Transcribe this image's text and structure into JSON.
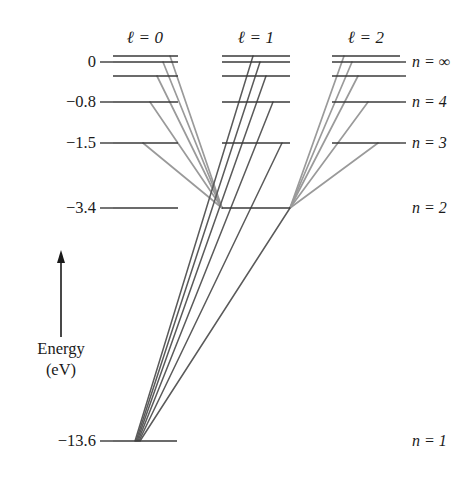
{
  "figure": {
    "background_color": "#ffffff",
    "width": 472,
    "height": 481
  },
  "axis": {
    "title_line1": "Energy",
    "title_line2": "(eV)",
    "arrow_direction": "up",
    "arrow_color": "#1a1a1a",
    "ticks": [
      {
        "label": "0",
        "y": 62
      },
      {
        "label": "−0.8",
        "y": 102
      },
      {
        "label": "−1.5",
        "y": 143
      },
      {
        "label": "−3.4",
        "y": 208
      },
      {
        "label": "−13.6",
        "y": 441
      }
    ]
  },
  "columns": [
    {
      "id": "l0",
      "header": "ℓ = 0",
      "header_x": 145,
      "x_start": 113,
      "x_end": 178
    },
    {
      "id": "l1",
      "header": "ℓ = 1",
      "header_x": 256,
      "x_start": 222,
      "x_end": 290
    },
    {
      "id": "l2",
      "header": "ℓ = 2",
      "header_x": 366,
      "x_start": 332,
      "x_end": 400
    }
  ],
  "right_labels": [
    {
      "label": "n = ∞",
      "y": 62
    },
    {
      "label": "n = 4",
      "y": 102
    },
    {
      "label": "n = 3",
      "y": 143
    },
    {
      "label": "n = 2",
      "y": 208
    },
    {
      "label": "n = 1",
      "y": 441
    }
  ],
  "level_color": "#3a3a3a",
  "transition_colors": {
    "light": "#9a9a9a",
    "dark": "#5a5a5a"
  },
  "chart_data": {
    "type": "line",
    "xlabel": "Orbital angular momentum quantum number ℓ",
    "ylabel": "Energy (eV)",
    "ylim": [
      -13.6,
      0
    ],
    "grid": false,
    "legend": "none",
    "x_categories": [
      "ℓ = 0",
      "ℓ = 1",
      "ℓ = 2"
    ],
    "y_tick_labels": [
      "0",
      "−0.8",
      "−1.5",
      "−3.4",
      "−13.6"
    ],
    "y_tick_values": [
      0,
      -0.8,
      -1.5,
      -3.4,
      -13.6
    ],
    "levels": [
      {
        "column": "l0",
        "n": "∞",
        "energy": 0.0,
        "y": 56,
        "x1": 113,
        "x2": 178
      },
      {
        "column": "l0",
        "n": "6",
        "energy": -0.38,
        "y": 62,
        "x1": 113,
        "x2": 178
      },
      {
        "column": "l0",
        "n": "5",
        "energy": -0.54,
        "y": 76,
        "x1": 113,
        "x2": 178
      },
      {
        "column": "l0",
        "n": "4",
        "energy": -0.85,
        "y": 102,
        "x1": 113,
        "x2": 178
      },
      {
        "column": "l0",
        "n": "3",
        "energy": -1.51,
        "y": 143,
        "x1": 113,
        "x2": 178
      },
      {
        "column": "l0",
        "n": "2",
        "energy": -3.4,
        "y": 208,
        "x1": 113,
        "x2": 178
      },
      {
        "column": "l0",
        "n": "1",
        "energy": -13.6,
        "y": 441,
        "x1": 113,
        "x2": 177
      },
      {
        "column": "l1",
        "n": "∞",
        "energy": 0.0,
        "y": 56,
        "x1": 222,
        "x2": 290
      },
      {
        "column": "l1",
        "n": "6",
        "energy": -0.38,
        "y": 62,
        "x1": 222,
        "x2": 290
      },
      {
        "column": "l1",
        "n": "5",
        "energy": -0.54,
        "y": 76,
        "x1": 222,
        "x2": 290
      },
      {
        "column": "l1",
        "n": "4",
        "energy": -0.85,
        "y": 102,
        "x1": 222,
        "x2": 290
      },
      {
        "column": "l1",
        "n": "3",
        "energy": -1.51,
        "y": 143,
        "x1": 222,
        "x2": 290
      },
      {
        "column": "l1",
        "n": "2",
        "energy": -3.4,
        "y": 208,
        "x1": 222,
        "x2": 290
      },
      {
        "column": "l2",
        "n": "∞",
        "energy": 0.0,
        "y": 56,
        "x1": 332,
        "x2": 400
      },
      {
        "column": "l2",
        "n": "6",
        "energy": -0.38,
        "y": 62,
        "x1": 332,
        "x2": 400
      },
      {
        "column": "l2",
        "n": "5",
        "energy": -0.54,
        "y": 76,
        "x1": 332,
        "x2": 400
      },
      {
        "column": "l2",
        "n": "4",
        "energy": -0.85,
        "y": 102,
        "x1": 332,
        "x2": 400
      },
      {
        "column": "l2",
        "n": "3",
        "energy": -1.51,
        "y": 143,
        "x1": 332,
        "x2": 400
      }
    ],
    "transitions": [
      {
        "from_column": "l0",
        "to_column": "l1",
        "from_n": "∞",
        "to_n": "2",
        "x1": 170,
        "y1": 56,
        "x2": 222,
        "y2": 208,
        "shade": "light"
      },
      {
        "from_column": "l0",
        "to_column": "l1",
        "from_n": "6",
        "to_n": "2",
        "x1": 163,
        "y1": 62,
        "x2": 222,
        "y2": 208,
        "shade": "light"
      },
      {
        "from_column": "l0",
        "to_column": "l1",
        "from_n": "5",
        "to_n": "2",
        "x1": 157,
        "y1": 76,
        "x2": 222,
        "y2": 208,
        "shade": "light"
      },
      {
        "from_column": "l0",
        "to_column": "l1",
        "from_n": "4",
        "to_n": "2",
        "x1": 150,
        "y1": 102,
        "x2": 222,
        "y2": 208,
        "shade": "light"
      },
      {
        "from_column": "l0",
        "to_column": "l1",
        "from_n": "3",
        "to_n": "2",
        "x1": 143,
        "y1": 143,
        "x2": 222,
        "y2": 208,
        "shade": "light"
      },
      {
        "from_column": "l2",
        "to_column": "l1",
        "from_n": "∞",
        "to_n": "2",
        "x1": 344,
        "y1": 56,
        "x2": 290,
        "y2": 208,
        "shade": "light"
      },
      {
        "from_column": "l2",
        "to_column": "l1",
        "from_n": "6",
        "to_n": "2",
        "x1": 352,
        "y1": 62,
        "x2": 290,
        "y2": 208,
        "shade": "light"
      },
      {
        "from_column": "l2",
        "to_column": "l1",
        "from_n": "5",
        "to_n": "2",
        "x1": 358,
        "y1": 76,
        "x2": 290,
        "y2": 208,
        "shade": "light"
      },
      {
        "from_column": "l2",
        "to_column": "l1",
        "from_n": "4",
        "to_n": "2",
        "x1": 368,
        "y1": 102,
        "x2": 290,
        "y2": 208,
        "shade": "light"
      },
      {
        "from_column": "l2",
        "to_column": "l1",
        "from_n": "3",
        "to_n": "2",
        "x1": 378,
        "y1": 143,
        "x2": 290,
        "y2": 208,
        "shade": "light"
      },
      {
        "from_column": "l1",
        "to_column": "l0",
        "from_n": "∞",
        "to_n": "1",
        "x1": 253,
        "y1": 56,
        "x2": 135,
        "y2": 441,
        "shade": "dark"
      },
      {
        "from_column": "l1",
        "to_column": "l0",
        "from_n": "6",
        "to_n": "1",
        "x1": 260,
        "y1": 62,
        "x2": 136,
        "y2": 441,
        "shade": "dark"
      },
      {
        "from_column": "l1",
        "to_column": "l0",
        "from_n": "5",
        "to_n": "1",
        "x1": 266,
        "y1": 76,
        "x2": 137,
        "y2": 441,
        "shade": "dark"
      },
      {
        "from_column": "l1",
        "to_column": "l0",
        "from_n": "4",
        "to_n": "1",
        "x1": 273,
        "y1": 102,
        "x2": 138,
        "y2": 441,
        "shade": "dark"
      },
      {
        "from_column": "l1",
        "to_column": "l0",
        "from_n": "3",
        "to_n": "1",
        "x1": 282,
        "y1": 143,
        "x2": 139,
        "y2": 441,
        "shade": "dark"
      },
      {
        "from_column": "l1",
        "to_column": "l0",
        "from_n": "2",
        "to_n": "1",
        "x1": 290,
        "y1": 208,
        "x2": 140,
        "y2": 441,
        "shade": "dark"
      }
    ]
  }
}
